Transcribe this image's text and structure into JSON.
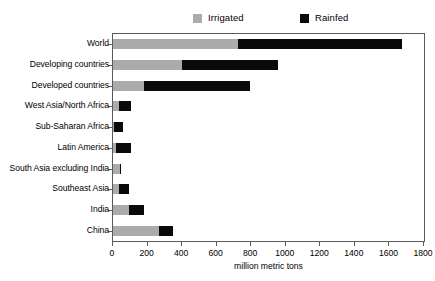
{
  "chart_data": {
    "type": "bar",
    "orientation": "horizontal",
    "stacked": true,
    "title": "",
    "xlabel": "million metric tons",
    "ylabel": "",
    "xlim": [
      0,
      1800
    ],
    "xticks": [
      0,
      200,
      400,
      600,
      800,
      1000,
      1200,
      1400,
      1600,
      1800
    ],
    "xtick_labels": [
      "0",
      "200",
      "400",
      "600",
      "800",
      "1000",
      "1200",
      "1400",
      "1600",
      "1800"
    ],
    "grid": false,
    "legend_position": "top",
    "categories": [
      "World",
      "Developing countries",
      "Developed countries",
      "West Asia/North Africa",
      "Sub-Saharan Africa",
      "Latin America",
      "South Asia excluding India",
      "Southeast Asia",
      "India",
      "China"
    ],
    "series": [
      {
        "name": "Irrigated",
        "color": "#ababab",
        "values": [
          725,
          400,
          180,
          35,
          8,
          20,
          40,
          35,
          95,
          265
        ]
      },
      {
        "name": "Rainfed",
        "color": "#0a0a0a",
        "values": [
          950,
          555,
          615,
          70,
          52,
          85,
          5,
          60,
          85,
          85
        ]
      }
    ],
    "totals": [
      1675,
      955,
      795,
      105,
      60,
      105,
      45,
      95,
      180,
      350
    ]
  },
  "legend": {
    "entries": [
      {
        "label": "Irrigated",
        "color": "#ababab",
        "swatch": "square-swatch"
      },
      {
        "label": "Rainfed",
        "color": "#0a0a0a",
        "swatch": "square-swatch"
      }
    ]
  },
  "axis": {
    "x_title": "million metric tons"
  }
}
